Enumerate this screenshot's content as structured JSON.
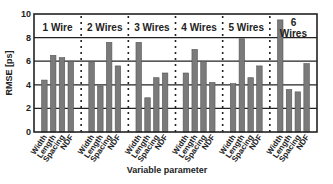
{
  "chart_data": {
    "type": "bar",
    "title": "",
    "xlabel": "Variable parameter",
    "ylabel": "RMSE [ps]",
    "ylim": [
      0,
      10
    ],
    "yticks": [
      0,
      2,
      4,
      6,
      8,
      10
    ],
    "grid": true,
    "legend": null,
    "groups": [
      "1 Wire",
      "2 Wires",
      "3 Wires",
      "4 Wires",
      "5 Wires",
      "6 Wires"
    ],
    "categories": [
      "Width",
      "Length",
      "Spacing",
      "NDF"
    ],
    "series": [
      {
        "name": "1 Wire",
        "values": [
          4.4,
          6.5,
          6.3,
          6.0
        ]
      },
      {
        "name": "2 Wires",
        "values": [
          5.9,
          3.9,
          7.6,
          5.6
        ]
      },
      {
        "name": "3 Wires",
        "values": [
          7.6,
          2.9,
          4.6,
          5.0
        ]
      },
      {
        "name": "4 Wires",
        "values": [
          5.0,
          7.0,
          6.0,
          4.2
        ]
      },
      {
        "name": "5 Wires",
        "values": [
          4.1,
          7.9,
          4.6,
          5.6
        ]
      },
      {
        "name": "6 Wires",
        "values": [
          9.5,
          3.6,
          3.4,
          5.8
        ]
      }
    ],
    "colors": {
      "bar": "#7a7a7a",
      "bar_edge": "#555555",
      "axis": "#222222",
      "grid": "#222222",
      "separator": "#222222"
    }
  }
}
